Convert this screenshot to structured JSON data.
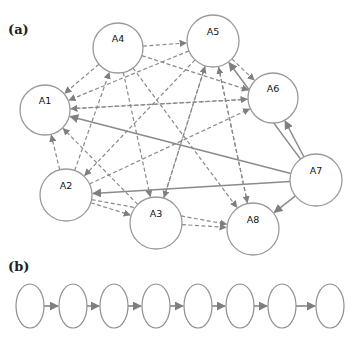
{
  "panels": {
    "a": {
      "label": "(a)",
      "nodes": [
        {
          "id": "A1",
          "label": "A1",
          "cx": 45,
          "cy": 110,
          "r": 25
        },
        {
          "id": "A2",
          "label": "A2",
          "cx": 66,
          "cy": 195,
          "r": 26
        },
        {
          "id": "A3",
          "label": "A3",
          "cx": 156,
          "cy": 223,
          "r": 26
        },
        {
          "id": "A4",
          "label": "A4",
          "cx": 118,
          "cy": 48,
          "r": 25
        },
        {
          "id": "A5",
          "label": "A5",
          "cx": 213,
          "cy": 41,
          "r": 26
        },
        {
          "id": "A6",
          "label": "A6",
          "cx": 273,
          "cy": 98,
          "r": 25
        },
        {
          "id": "A7",
          "label": "A7",
          "cx": 316,
          "cy": 180,
          "r": 26
        },
        {
          "id": "A8",
          "label": "A8",
          "cx": 253,
          "cy": 229,
          "r": 26
        }
      ],
      "edges": [
        {
          "from": "A4",
          "to": "A1",
          "style": "dashed"
        },
        {
          "from": "A4",
          "to": "A5",
          "style": "dashed"
        },
        {
          "from": "A4",
          "to": "A6",
          "style": "dashed"
        },
        {
          "from": "A4",
          "to": "A3",
          "style": "dashed"
        },
        {
          "from": "A4",
          "to": "A8",
          "style": "dashed"
        },
        {
          "from": "A5",
          "to": "A1",
          "style": "dashed"
        },
        {
          "from": "A5",
          "to": "A6",
          "style": "dashed"
        },
        {
          "from": "A5",
          "to": "A3",
          "style": "dashed"
        },
        {
          "from": "A5",
          "to": "A8",
          "style": "dashed"
        },
        {
          "from": "A5",
          "to": "A2",
          "style": "dashed"
        },
        {
          "from": "A6",
          "to": "A1",
          "style": "dashed"
        },
        {
          "from": "A2",
          "to": "A4",
          "style": "dashed"
        },
        {
          "from": "A2",
          "to": "A1",
          "style": "dashed"
        },
        {
          "from": "A2",
          "to": "A3",
          "style": "dashed"
        },
        {
          "from": "A2",
          "to": "A8",
          "style": "dashed"
        },
        {
          "from": "A2",
          "to": "A6",
          "style": "dashed"
        },
        {
          "from": "A3",
          "to": "A1",
          "style": "dashed"
        },
        {
          "from": "A3",
          "to": "A8",
          "style": "dashed"
        },
        {
          "from": "A3",
          "to": "A5",
          "style": "dashed"
        },
        {
          "from": "A1",
          "to": "A6",
          "style": "dashed"
        },
        {
          "from": "A8",
          "to": "A5",
          "style": "dashed"
        },
        {
          "from": "A7",
          "to": "A1",
          "style": "solid"
        },
        {
          "from": "A7",
          "to": "A2",
          "style": "solid"
        },
        {
          "from": "A7",
          "to": "A5",
          "style": "solid"
        },
        {
          "from": "A7",
          "to": "A6",
          "style": "solid"
        },
        {
          "from": "A7",
          "to": "A8",
          "style": "solid"
        }
      ]
    },
    "b": {
      "label": "(b)",
      "chain": [
        {
          "cx": 30,
          "cy": 306
        },
        {
          "cx": 73,
          "cy": 306
        },
        {
          "cx": 114,
          "cy": 306
        },
        {
          "cx": 156,
          "cy": 306
        },
        {
          "cx": 198,
          "cy": 306
        },
        {
          "cx": 240,
          "cy": 306
        },
        {
          "cx": 282,
          "cy": 306
        },
        {
          "cx": 330,
          "cy": 306
        }
      ],
      "rx": 14,
      "ry": 22
    }
  },
  "colors": {
    "node_stroke": "#9a9a9a",
    "edge": "#8a8a8a",
    "text": "#111111"
  }
}
